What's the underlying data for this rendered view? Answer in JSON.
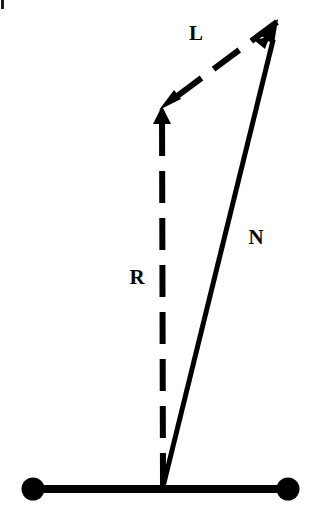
{
  "figure": {
    "background_color": "#ffffff",
    "ink_color": "#000000",
    "width": 312,
    "height": 518
  },
  "labels": {
    "light_vector": "L",
    "normal_vector": "N",
    "reflection_vector": "R"
  },
  "chart_data": {
    "type": "diagram",
    "xlabel": "",
    "ylabel": "",
    "grid": false,
    "legend": "none",
    "xlim": [
      0,
      312
    ],
    "ylim": [
      0,
      518
    ],
    "note": "Coordinates are in image pixel space with origin at top-left; y increases downward.",
    "surface": {
      "name": "surface-line",
      "style": "solid",
      "stroke_width": 8,
      "x1": 33,
      "y1": 489,
      "x2": 288,
      "y2": 489,
      "endpoints": [
        {
          "name": "left-endpoint",
          "x": 33,
          "y": 489,
          "radius": 11,
          "filled": true
        },
        {
          "name": "right-endpoint",
          "x": 288,
          "y": 489,
          "radius": 11,
          "filled": true
        }
      ]
    },
    "incidence_point": {
      "x": 163,
      "y": 487
    },
    "vectors": [
      {
        "name": "N",
        "label": "N",
        "style": "solid",
        "stroke_width": 5,
        "tail": {
          "x": 163,
          "y": 487
        },
        "head": {
          "x": 278,
          "y": 20
        },
        "arrowhead": true,
        "arrow_at": "head",
        "label_position": {
          "x": 256,
          "y": 237
        }
      },
      {
        "name": "R",
        "label": "R",
        "style": "dashed",
        "stroke_width": 6,
        "dash_length": 32,
        "gap_length": 15,
        "tail": {
          "x": 163,
          "y": 485
        },
        "head": {
          "x": 162,
          "y": 107
        },
        "arrowhead": true,
        "arrow_at": "head",
        "label_position": {
          "x": 137,
          "y": 277
        }
      },
      {
        "name": "L",
        "label": "L",
        "style": "dashed",
        "stroke_width": 6,
        "dash_length": 32,
        "gap_length": 15,
        "tail": {
          "x": 277,
          "y": 22
        },
        "head": {
          "x": 161,
          "y": 108
        },
        "arrowhead": true,
        "arrow_at": "head",
        "label_position": {
          "x": 196,
          "y": 33
        }
      }
    ]
  }
}
